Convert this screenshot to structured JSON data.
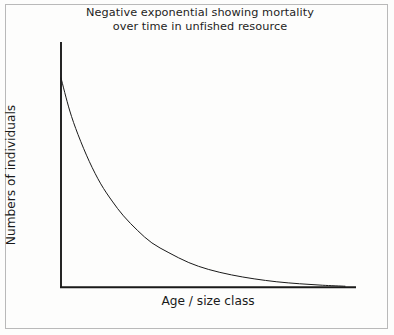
{
  "figure": {
    "background_color": "#fdfdfc",
    "frame_color": "#b9b9b9",
    "ink_color": "#1a1a1a"
  },
  "chart_data": {
    "type": "line",
    "title": "Negative exponential showing mortality\nover time in unfished resource",
    "title_line_1": "Negative exponential showing mortality",
    "title_line_2": "over time in unfished resource",
    "xlabel": "Age / size class",
    "ylabel": "Numbers of individuals",
    "grid": false,
    "legend": null,
    "xlim": [
      0,
      100
    ],
    "ylim": [
      0,
      100
    ],
    "xtick_labels": [],
    "ytick_labels": [],
    "annotations": [],
    "series": [
      {
        "name": "Negative exponential mortality",
        "color": "#1a1a1a",
        "line_width": 1,
        "description": "Monotonic negative exponential decay from a high initial abundance, approaching zero asymptotically at large age / size class",
        "x": [
          0,
          3,
          6,
          10,
          14,
          18,
          22,
          27,
          32,
          38,
          45,
          52,
          60,
          68,
          76,
          84,
          92,
          100
        ],
        "y": [
          85,
          72,
          62,
          51,
          42,
          35,
          29,
          23,
          18,
          14,
          10,
          7.2,
          5.0,
          3.4,
          2.2,
          1.4,
          0.8,
          0.4
        ]
      }
    ]
  },
  "axes": {
    "y_axis_name": "y-axis-line",
    "x_axis_name": "x-axis-line"
  }
}
